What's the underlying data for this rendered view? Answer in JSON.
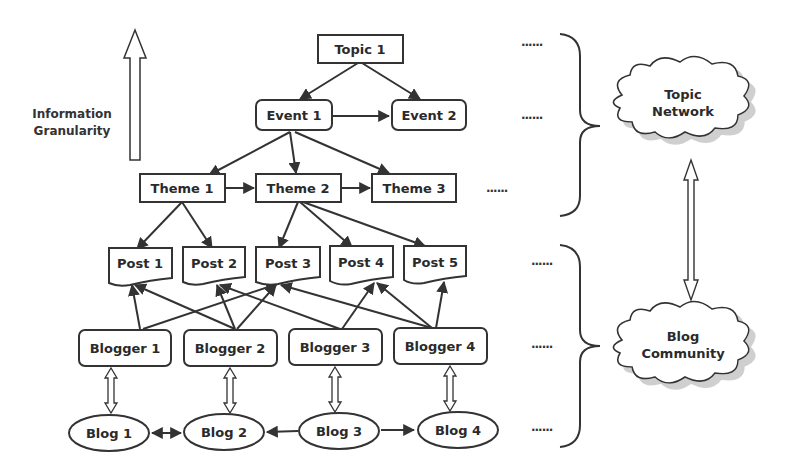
{
  "diagram": {
    "axis_label": {
      "line1": "Information",
      "line2": "Granularity"
    },
    "topics": [
      {
        "id": "topic1",
        "label": "Topic 1"
      }
    ],
    "events": [
      {
        "id": "event1",
        "label": "Event 1"
      },
      {
        "id": "event2",
        "label": "Event 2"
      }
    ],
    "themes": [
      {
        "id": "theme1",
        "label": "Theme 1"
      },
      {
        "id": "theme2",
        "label": "Theme 2"
      },
      {
        "id": "theme3",
        "label": "Theme 3"
      }
    ],
    "posts": [
      {
        "id": "post1",
        "label": "Post 1"
      },
      {
        "id": "post2",
        "label": "Post 2"
      },
      {
        "id": "post3",
        "label": "Post 3"
      },
      {
        "id": "post4",
        "label": "Post 4"
      },
      {
        "id": "post5",
        "label": "Post 5"
      }
    ],
    "bloggers": [
      {
        "id": "blogger1",
        "label": "Blogger 1"
      },
      {
        "id": "blogger2",
        "label": "Blogger 2"
      },
      {
        "id": "blogger3",
        "label": "Blogger 3"
      },
      {
        "id": "blogger4",
        "label": "Blogger 4"
      }
    ],
    "blogs": [
      {
        "id": "blog1",
        "label": "Blog 1"
      },
      {
        "id": "blog2",
        "label": "Blog 2"
      },
      {
        "id": "blog3",
        "label": "Blog 3"
      },
      {
        "id": "blog4",
        "label": "Blog 4"
      }
    ],
    "ellipsis": "......",
    "clouds": {
      "topic_network": {
        "line1": "Topic",
        "line2": "Network"
      },
      "blog_community": {
        "line1": "Blog",
        "line2": "Community"
      }
    },
    "edges": [
      [
        "topic1",
        "event1"
      ],
      [
        "topic1",
        "event2"
      ],
      [
        "event1",
        "event2"
      ],
      [
        "event1",
        "theme1"
      ],
      [
        "event1",
        "theme2"
      ],
      [
        "event1",
        "theme3"
      ],
      [
        "theme1",
        "theme2"
      ],
      [
        "theme2",
        "theme3"
      ],
      [
        "theme1",
        "post1"
      ],
      [
        "theme1",
        "post2"
      ],
      [
        "theme2",
        "post3"
      ],
      [
        "theme2",
        "post4"
      ],
      [
        "theme2",
        "post5"
      ],
      [
        "blogger1",
        "post1"
      ],
      [
        "blogger1",
        "post3"
      ],
      [
        "blogger2",
        "post1"
      ],
      [
        "blogger2",
        "post2"
      ],
      [
        "blogger2",
        "post3"
      ],
      [
        "blogger3",
        "post2"
      ],
      [
        "blogger3",
        "post4"
      ],
      [
        "blogger4",
        "post3"
      ],
      [
        "blogger4",
        "post4"
      ],
      [
        "blogger4",
        "post5"
      ],
      [
        "blog1",
        "blog2",
        "bidirectional"
      ],
      [
        "blog3",
        "blog2"
      ],
      [
        "blog3",
        "blog4"
      ]
    ]
  }
}
